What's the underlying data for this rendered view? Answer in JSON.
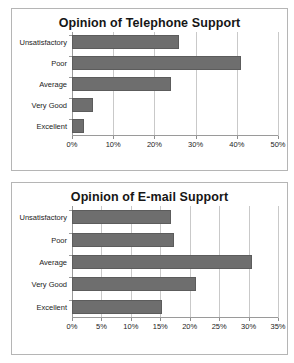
{
  "chart_data": [
    {
      "type": "bar",
      "orientation": "horizontal",
      "title": "Opinion of Telephone Support",
      "categories": [
        "Unsatisfactory",
        "Poor",
        "Average",
        "Very Good",
        "Excellent"
      ],
      "values": [
        26,
        41,
        24,
        5,
        3
      ],
      "tick_labels": [
        "0%",
        "10%",
        "20%",
        "30%",
        "40%",
        "50%"
      ],
      "tick_values": [
        0,
        10,
        20,
        30,
        40,
        50
      ],
      "xlabel": "",
      "ylabel": "",
      "xlim": [
        0,
        50
      ],
      "grid": true,
      "legend": false,
      "bar_color": "#6e6e6e"
    },
    {
      "type": "bar",
      "orientation": "horizontal",
      "title": "Opinion of E-mail Support",
      "categories": [
        "Unsatisfactory",
        "Poor",
        "Average",
        "Very Good",
        "Excellent"
      ],
      "values": [
        16.8,
        17.3,
        30.5,
        21,
        15.3
      ],
      "tick_labels": [
        "0%",
        "5%",
        "10%",
        "15%",
        "20%",
        "25%",
        "30%",
        "35%"
      ],
      "tick_values": [
        0,
        5,
        10,
        15,
        20,
        25,
        30,
        35
      ],
      "xlabel": "",
      "ylabel": "",
      "xlim": [
        0,
        35
      ],
      "grid": true,
      "legend": false,
      "bar_color": "#6e6e6e"
    }
  ]
}
